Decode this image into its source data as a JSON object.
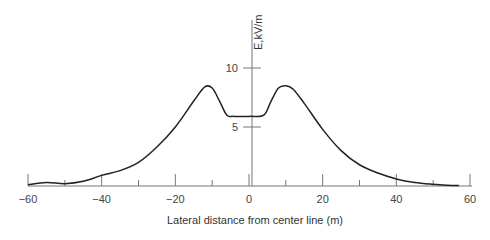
{
  "chart_data": {
    "type": "line",
    "title": "",
    "xlabel": "Lateral distance from center line (m)",
    "ylabel": "E,kV/m",
    "xlim": [
      -60,
      60
    ],
    "ylim": [
      0,
      12
    ],
    "x_ticks": [
      "-60",
      "-40",
      "-20",
      "0",
      "20",
      "40",
      "60"
    ],
    "y_ticks": [
      "5",
      "10"
    ],
    "grid": false,
    "legend": null,
    "series": [
      {
        "name": "Electric field",
        "x": [
          -60,
          -55,
          -50,
          -45,
          -40,
          -35,
          -30,
          -25,
          -20,
          -15,
          -12,
          -10,
          -8,
          -6,
          -4,
          0,
          4,
          6,
          8,
          10,
          12,
          15,
          20,
          25,
          30,
          35,
          40,
          45,
          50,
          55,
          57
        ],
        "y": [
          0.1,
          0.3,
          0.2,
          0.4,
          0.9,
          1.3,
          2.0,
          3.3,
          5.0,
          7.2,
          8.4,
          8.3,
          7.2,
          6.0,
          5.9,
          5.9,
          6.0,
          7.2,
          8.3,
          8.5,
          8.2,
          7.0,
          4.8,
          3.0,
          1.8,
          1.1,
          0.6,
          0.3,
          0.15,
          0.05,
          0.05
        ]
      }
    ]
  },
  "colors": {
    "line": "#222222",
    "axis": "#777777",
    "text": "#444444"
  }
}
